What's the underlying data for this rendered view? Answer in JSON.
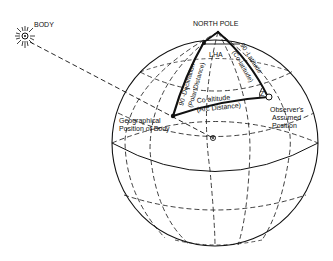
{
  "diagram": {
    "labels": {
      "body": "BODY",
      "north_pole": "NORTH POLE",
      "lha": "LHA",
      "declination_side": "90 -Declination",
      "polar_distance": "(Polar Distance)",
      "latitude_side": "90 -Latitude",
      "co_latitude": "(Co-latitude)",
      "co_altitude": "Co altitude",
      "arc_distance": "(Arc Distance)",
      "angle_z": "Z",
      "geo_position_line1": "Geographical",
      "geo_position_line2": "Position of Body",
      "observer_line1": "Observer's",
      "observer_line2": "Assumed",
      "observer_line3": "Position"
    },
    "colors": {
      "ink": "#111111",
      "background": "#ffffff"
    }
  }
}
